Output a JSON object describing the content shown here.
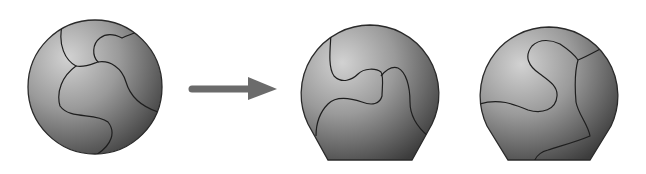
{
  "diagram": {
    "description": "Three shaded spheres with boundary lines; first sphere transforms (arrow) into two resulting spheres",
    "colors": {
      "background": "#ffffff",
      "sphere_light": "#c8c8c8",
      "sphere_mid": "#8a8a8a",
      "sphere_dark": "#3a3a3a",
      "outline": "#2a2a2a",
      "boundary": "#1e1e1e",
      "arrow": "#6b6b6b"
    },
    "nodes": [
      {
        "id": "sphere-initial",
        "cx": 95,
        "cy": 87,
        "r": 67,
        "label": ""
      },
      {
        "id": "sphere-result-1",
        "cx": 370,
        "cy": 94,
        "r": 69,
        "label": "",
        "flat_bottom_y": 160
      },
      {
        "id": "sphere-result-2",
        "cx": 549,
        "cy": 96,
        "r": 69,
        "label": "",
        "flat_bottom_y": 160
      }
    ],
    "edges": [
      {
        "from": "sphere-initial",
        "to": "sphere-result-1",
        "type": "arrow",
        "x1": 190,
        "y1": 89,
        "x2": 276,
        "y2": 89
      }
    ]
  }
}
